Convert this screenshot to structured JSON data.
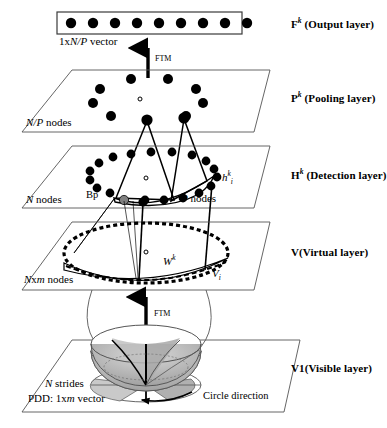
{
  "figure": {
    "type": "layered-neural-network-architecture-diagram",
    "background": "#ffffff",
    "ink": "#000000",
    "plane_stroke": "#555555",
    "node_fill": "#000000",
    "bp_node_fill": "#808080",
    "bowl_fill": "#b3b3b3"
  },
  "layers": [
    {
      "id": "output",
      "name": "F",
      "superscript": "k",
      "label": "(Output layer)",
      "shape": "rectangle",
      "node_count_text": "1x",
      "vector_label_italic": "N/P",
      "vector_label_tail": " vector",
      "nodes": 9
    },
    {
      "id": "pooling",
      "name": "P",
      "superscript": "k",
      "label": "(Pooling layer)",
      "shape": "parallelogram",
      "node_count_italic": "N/P",
      "node_count_tail": " nodes",
      "nodes": 10,
      "center_marker": "hollow-circle"
    },
    {
      "id": "detection",
      "name": "H",
      "superscript": "k",
      "label": "(Detection layer)",
      "shape": "parallelogram",
      "node_count_italic": "N",
      "node_count_tail": " nodes",
      "nodes": 20,
      "center_marker": "hollow-circle",
      "bp_label": "Bp",
      "p_nodes_italic": "P",
      "p_nodes_tail": " nodes",
      "h_symbol": "h",
      "h_superscript": "k",
      "h_subscript": "i"
    },
    {
      "id": "virtual",
      "name": "V",
      "superscript": "",
      "label": "(Virtual layer)",
      "shape": "parallelogram",
      "node_count_italic": "N",
      "node_count_mid": "x",
      "node_count_italic2": "m",
      "node_count_tail": " nodes",
      "center_marker": "hollow-circle",
      "w_symbol": "W",
      "w_superscript": "k",
      "v_symbol": "V",
      "v_subscript": "i"
    },
    {
      "id": "visible",
      "name": "V1",
      "superscript": "",
      "label": "(Visible layer)",
      "shape": "parallelogram",
      "strides_italic": "N",
      "strides_tail": " strides",
      "pdd_head": "PDD: 1x",
      "pdd_italic": "m",
      "pdd_tail": " vector",
      "circle_direction": "Circle direction"
    }
  ],
  "arrows": [
    {
      "id": "ftm-top",
      "label": "FTM",
      "direction": "up",
      "from": "pooling",
      "to": "output"
    },
    {
      "id": "ftm-bottom",
      "label": "FTM",
      "direction": "up",
      "from": "visible",
      "to": "virtual"
    }
  ],
  "layer_names": {
    "output": "F",
    "pooling": "P",
    "detection": "H",
    "virtual": "V",
    "visible": "V1"
  },
  "layer_labels": {
    "output": "(Output layer)",
    "pooling": "(Pooling layer)",
    "detection": "(Detection layer)",
    "virtual": "(Virtual layer)",
    "visible": "(Visible layer)"
  },
  "superscripts": {
    "output": "k",
    "pooling": "k",
    "detection": "k"
  },
  "texts": {
    "ftm": "FTM",
    "bp": "Bp",
    "circle_direction": "Circle direction",
    "vector_prefix": "1x",
    "vector_suffix": " vector",
    "nodes_suffix": " nodes",
    "strides_suffix": " strides",
    "pdd_prefix": "PDD: 1x",
    "pdd_suffix": " vector",
    "np": "N/P",
    "n": "N",
    "m": "m",
    "p": "P",
    "x": "x",
    "h": "h",
    "w": "W",
    "v": "V",
    "k": "k",
    "i": "i"
  }
}
